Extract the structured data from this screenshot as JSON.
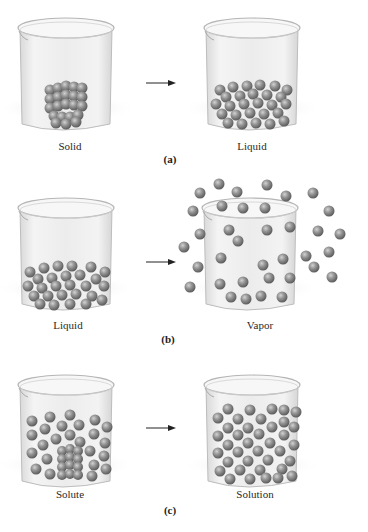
{
  "figure": {
    "panels": [
      {
        "id": "a",
        "letter": "(a)",
        "left_label": "Solid",
        "right_label": "Liquid",
        "left_state": "solid",
        "right_state": "liquid"
      },
      {
        "id": "b",
        "letter": "(b)",
        "left_label": "Liquid",
        "right_label": "Vapor",
        "left_state": "liquid",
        "right_state": "vapor"
      },
      {
        "id": "c",
        "letter": "(c)",
        "left_label": "Solute",
        "right_label": "Solution",
        "left_state": "solute",
        "right_state": "solution"
      }
    ],
    "colors": {
      "particle": "#8a8a8a",
      "particle_highlight": "#c8c8c8",
      "particle_shadow": "#5e5e5e",
      "beaker_fill": "#ebebeb",
      "beaker_stroke": "#b5b5b5",
      "arrow": "#222222"
    }
  }
}
